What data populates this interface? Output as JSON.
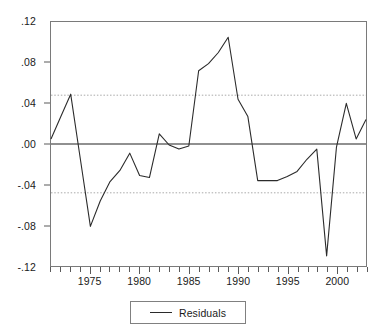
{
  "chart_data": {
    "type": "line",
    "title": "",
    "xlabel": "",
    "ylabel": "",
    "xlim": [
      1971,
      2003
    ],
    "ylim": [
      -0.12,
      0.12
    ],
    "grid": true,
    "legend_position": "bottom-center",
    "y_ticks": [
      {
        "value": 0.12,
        "label": ".12"
      },
      {
        "value": 0.08,
        "label": ".08"
      },
      {
        "value": 0.04,
        "label": ".04"
      },
      {
        "value": 0.0,
        "label": ".00"
      },
      {
        "value": -0.04,
        "label": "-.04"
      },
      {
        "value": -0.08,
        "label": "-.08"
      },
      {
        "value": -0.12,
        "label": "-.12"
      }
    ],
    "x_ticks": [
      1971,
      1972,
      1973,
      1974,
      1975,
      1976,
      1977,
      1978,
      1979,
      1980,
      1981,
      1982,
      1983,
      1984,
      1985,
      1986,
      1987,
      1988,
      1989,
      1990,
      1991,
      1992,
      1993,
      1994,
      1995,
      1996,
      1997,
      1998,
      1999,
      2000,
      2001,
      2002,
      2003
    ],
    "x_tick_labels": [
      {
        "value": 1975,
        "label": "1975"
      },
      {
        "value": 1980,
        "label": "1980"
      },
      {
        "value": 1985,
        "label": "1985"
      },
      {
        "value": 1990,
        "label": "1990"
      },
      {
        "value": 1995,
        "label": "1995"
      },
      {
        "value": 2000,
        "label": "2000"
      }
    ],
    "reference_lines": [
      {
        "name": "zero-line",
        "value": 0.0,
        "style": "solid",
        "color": "#909090"
      },
      {
        "name": "upper-band-line",
        "value": 0.048,
        "style": "dotted",
        "color": "#a8a8a8"
      },
      {
        "name": "lower-band-line",
        "value": -0.048,
        "style": "dotted",
        "color": "#a8a8a8"
      }
    ],
    "series": [
      {
        "name": "Residuals",
        "color": "#2b2b2b",
        "x": [
          1971,
          1972,
          1973,
          1974,
          1975,
          1976,
          1977,
          1978,
          1979,
          1980,
          1981,
          1982,
          1983,
          1984,
          1985,
          1986,
          1987,
          1988,
          1989,
          1990,
          1991,
          1992,
          1993,
          1994,
          1995,
          1996,
          1997,
          1998,
          1999,
          2000,
          2001,
          2002,
          2003
        ],
        "values": [
          0.005,
          0.027,
          0.049,
          -0.016,
          -0.081,
          -0.056,
          -0.037,
          -0.026,
          -0.009,
          -0.031,
          -0.033,
          0.01,
          -0.001,
          -0.005,
          -0.002,
          0.072,
          0.079,
          0.09,
          0.105,
          0.044,
          0.027,
          -0.036,
          -0.036,
          -0.036,
          -0.032,
          -0.027,
          -0.015,
          -0.005,
          -0.11,
          -0.003,
          0.04,
          0.005,
          0.024
        ]
      }
    ]
  },
  "legend": {
    "entries": [
      {
        "label": "Residuals"
      }
    ]
  }
}
